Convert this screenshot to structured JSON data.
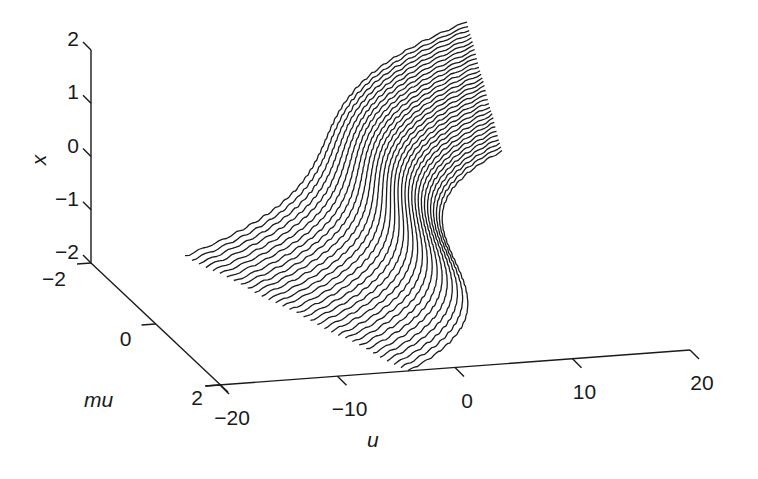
{
  "chart_data": {
    "type": "surface-3d",
    "title": "",
    "equation": "u = x^3 - mu*x",
    "xlabel": "u",
    "ylabel": "mu",
    "zlabel": "x",
    "u_range": [
      -20,
      20
    ],
    "mu_range": [
      -2,
      2
    ],
    "x_range": [
      -2,
      2
    ],
    "u_ticks": [
      -20,
      -10,
      0,
      10,
      20
    ],
    "u_tick_labels": [
      "−20",
      "−10",
      "0",
      "10",
      "20"
    ],
    "mu_ticks": [
      -2,
      0,
      2
    ],
    "mu_tick_labels": [
      "−2",
      "0",
      "2"
    ],
    "x_ticks": [
      2,
      1,
      0,
      -1,
      -2
    ],
    "x_tick_labels": [
      "2",
      "1",
      "0",
      "−1",
      "−2"
    ],
    "num_traces": 33,
    "trace_variable": "mu",
    "trace_parameter": "x",
    "corner_points": [
      {
        "x": -2,
        "mu": -2,
        "u": -12
      },
      {
        "x": 2,
        "mu": -2,
        "u": 12
      },
      {
        "x": -2,
        "mu": 2,
        "u": -4
      },
      {
        "x": 2,
        "mu": 2,
        "u": 4
      }
    ],
    "grid": false,
    "legend": null,
    "line_color": "#1c1c1c"
  },
  "axes": {
    "x_label": "x",
    "mu_label": "mu",
    "u_label": "u"
  }
}
